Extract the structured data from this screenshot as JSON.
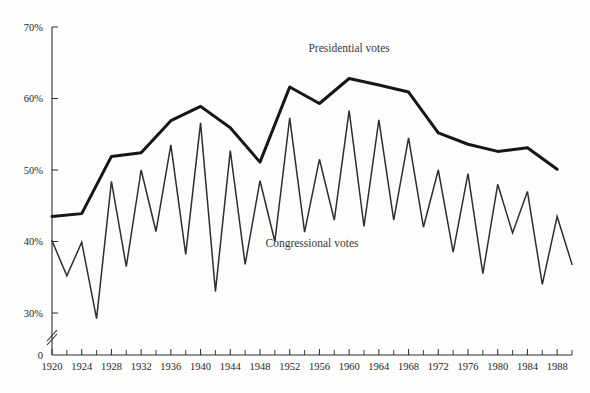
{
  "chart_data": {
    "type": "line",
    "title": "",
    "xlabel": "",
    "ylabel": "",
    "xlim": [
      1920,
      1990
    ],
    "ylim": [
      26,
      70
    ],
    "grid": false,
    "axis_break": true,
    "legend_position": "inline-annotation",
    "y_ticks": [
      30,
      40,
      50,
      60,
      70
    ],
    "y_tick_labels": [
      "30%",
      "40%",
      "50%",
      "60%",
      "70%"
    ],
    "y_axis_zero_label": "0",
    "x_ticks_major": [
      1920,
      1924,
      1928,
      1932,
      1936,
      1940,
      1944,
      1948,
      1952,
      1956,
      1960,
      1964,
      1968,
      1972,
      1976,
      1980,
      1984,
      1988
    ],
    "x_tick_labels": [
      "1920",
      "1924",
      "1928",
      "1932",
      "1936",
      "1940",
      "1944",
      "1948",
      "1952",
      "1956",
      "1960",
      "1964",
      "1968",
      "1972",
      "1976",
      "1980",
      "1984",
      "1988"
    ],
    "x_ticks_minor": [
      1922,
      1926,
      1930,
      1934,
      1938,
      1942,
      1946,
      1950,
      1954,
      1958,
      1962,
      1966,
      1970,
      1974,
      1978,
      1982,
      1986,
      1990
    ],
    "series": [
      {
        "name": "Presidential votes",
        "style": "thick",
        "label_x": 1960,
        "label_y": 66.5,
        "x": [
          1920,
          1924,
          1928,
          1932,
          1936,
          1940,
          1944,
          1948,
          1952,
          1956,
          1960,
          1964,
          1968,
          1972,
          1976,
          1980,
          1984,
          1988
        ],
        "values": [
          43.5,
          43.9,
          51.9,
          52.4,
          56.9,
          58.9,
          55.9,
          51.1,
          61.6,
          59.3,
          62.8,
          61.9,
          60.9,
          55.2,
          53.6,
          52.6,
          53.1,
          50.1
        ]
      },
      {
        "name": "Congressional votes",
        "style": "thin",
        "label_x": 1955,
        "label_y": 39.2,
        "x": [
          1920,
          1922,
          1924,
          1926,
          1928,
          1930,
          1932,
          1934,
          1936,
          1938,
          1940,
          1942,
          1944,
          1946,
          1948,
          1950,
          1952,
          1954,
          1956,
          1958,
          1960,
          1962,
          1964,
          1966,
          1968,
          1970,
          1972,
          1974,
          1976,
          1978,
          1980,
          1982,
          1984,
          1986,
          1988,
          1990
        ],
        "values": [
          40.1,
          35.2,
          39.9,
          29.2,
          48.4,
          36.5,
          50.0,
          41.4,
          53.5,
          38.2,
          56.6,
          33.0,
          52.7,
          36.8,
          48.5,
          40.0,
          57.3,
          41.3,
          51.5,
          43.0,
          58.3,
          42.1,
          57.0,
          43.0,
          54.5,
          42.0,
          50.0,
          38.5,
          49.5,
          35.5,
          48.0,
          41.2,
          47.0,
          34.0,
          43.5,
          36.8
        ]
      }
    ]
  }
}
